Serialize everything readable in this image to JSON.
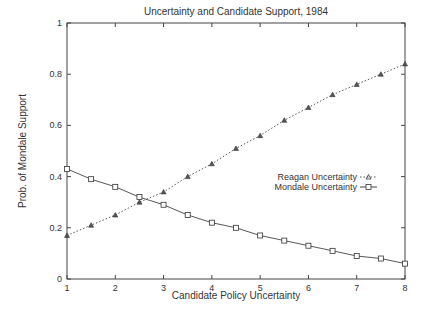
{
  "chart_data": {
    "type": "line",
    "title": "Uncertainty and Candidate Support, 1984",
    "xlabel": "Candidate Policy Uncertainty",
    "ylabel": "Prob. of Mondale Support",
    "xlim": [
      1,
      8
    ],
    "ylim": [
      0,
      1
    ],
    "xticks": [
      "1",
      "2",
      "3",
      "4",
      "5",
      "6",
      "7",
      "8"
    ],
    "yticks": [
      "0",
      "0.2",
      "0.4",
      "0.6",
      "0.8",
      "1"
    ],
    "grid": false,
    "legend_position": "right-middle",
    "x": [
      1,
      1.5,
      2,
      2.5,
      3,
      3.5,
      4,
      4.5,
      5,
      5.5,
      6,
      6.5,
      7,
      7.5,
      8
    ],
    "series": [
      {
        "name": "Reagan Uncertainty",
        "marker": "triangle",
        "line": "dotted",
        "values": [
          0.17,
          0.21,
          0.25,
          0.3,
          0.34,
          0.4,
          0.45,
          0.51,
          0.56,
          0.62,
          0.67,
          0.72,
          0.76,
          0.8,
          0.84
        ]
      },
      {
        "name": "Mondale Uncertainty",
        "marker": "square",
        "line": "solid",
        "values": [
          0.43,
          0.39,
          0.36,
          0.32,
          0.29,
          0.25,
          0.22,
          0.2,
          0.17,
          0.15,
          0.13,
          0.11,
          0.09,
          0.08,
          0.06
        ]
      }
    ]
  }
}
